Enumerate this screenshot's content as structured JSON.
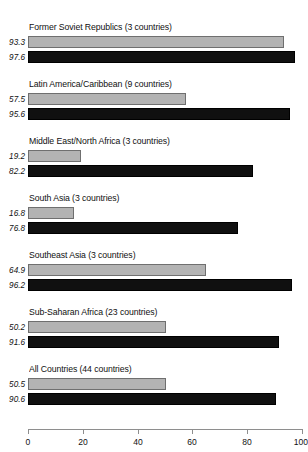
{
  "chart_data": {
    "type": "bar",
    "orientation": "horizontal",
    "title": "",
    "subtitle": "",
    "xlabel": "",
    "ylabel": "",
    "xlim": [
      0,
      100
    ],
    "xticks": [
      0,
      20,
      40,
      60,
      80,
      100
    ],
    "xtick_labels": [
      "0",
      "20",
      "40",
      "60",
      "80",
      "100"
    ],
    "grid": false,
    "legend": null,
    "legend_position": "none",
    "colors": {
      "light_series": "#b3b3b3",
      "light_series_border": "#6f6f6f",
      "dark_series": "#101010",
      "axis": "#8e8e8e",
      "text": "#111111",
      "background": "#ffffff"
    },
    "categories": [
      "Former Soviet Republics (3 countries)",
      "Latin America/Caribbean (9 countries)",
      "Middle East/North Africa (3 countries)",
      "South Asia (3 countries)",
      "Southeast Asia (3 countries)",
      "Sub-Saharan Africa (23 countries)",
      "All Countries (44 countries)"
    ],
    "series": [
      {
        "name": "light",
        "style": "light-gray",
        "values": [
          93.3,
          57.5,
          19.2,
          16.8,
          64.9,
          50.2,
          50.5
        ]
      },
      {
        "name": "dark",
        "style": "black",
        "values": [
          97.6,
          95.6,
          82.2,
          76.8,
          96.2,
          91.6,
          90.6
        ]
      }
    ],
    "value_labels": [
      [
        "93.3",
        "97.6"
      ],
      [
        "57.5",
        "95.6"
      ],
      [
        "19.2",
        "82.2"
      ],
      [
        "16.8",
        "76.8"
      ],
      [
        "64.9",
        "96.2"
      ],
      [
        "50.2",
        "91.6"
      ],
      [
        "50.5",
        "90.6"
      ]
    ]
  },
  "groups": [
    {
      "title": "Former Soviet Republics (3 countries)",
      "light_value": "93.3",
      "dark_value": "97.6"
    },
    {
      "title": "Latin America/Caribbean (9 countries)",
      "light_value": "57.5",
      "dark_value": "95.6"
    },
    {
      "title": "Middle East/North Africa (3 countries)",
      "light_value": "19.2",
      "dark_value": "82.2"
    },
    {
      "title": "South Asia (3 countries)",
      "light_value": "16.8",
      "dark_value": "76.8"
    },
    {
      "title": "Southeast Asia (3 countries)",
      "light_value": "64.9",
      "dark_value": "96.2"
    },
    {
      "title": "Sub-Saharan Africa (23 countries)",
      "light_value": "50.2",
      "dark_value": "91.6"
    },
    {
      "title": "All Countries (44 countries)",
      "light_value": "50.5",
      "dark_value": "90.6"
    }
  ],
  "axis": {
    "ticks": [
      "0",
      "20",
      "40",
      "60",
      "80",
      "100"
    ]
  }
}
